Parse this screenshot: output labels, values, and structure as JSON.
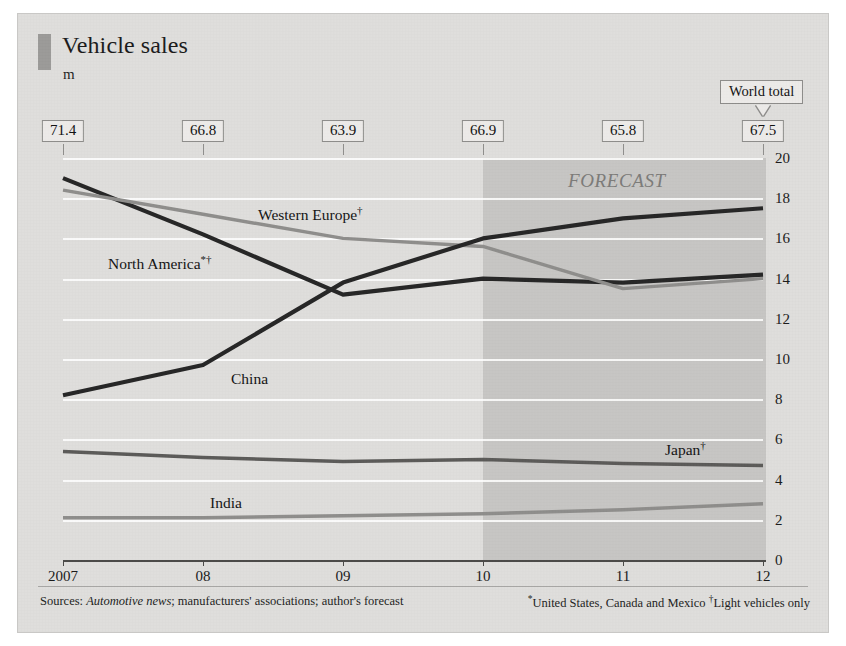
{
  "card": {
    "title": "Vehicle sales",
    "unit": "m",
    "forecast_label": "FORECAST",
    "world_total_label": "World total"
  },
  "footer": {
    "sources_prefix": "Sources: ",
    "sources_italic": "Automotive news",
    "sources_rest": "; manufacturers' associations; author's forecast",
    "footnotes": "*United States, Canada and Mexico  †Light vehicles only"
  },
  "colors": {
    "background": "#dedddb",
    "forecast_band": "#82807e",
    "north_america": "#262626",
    "china": "#262626",
    "western_europe": "#8e8d8b",
    "japan": "#5b5a58",
    "india": "#8e8d8b",
    "gridline": "#ffffff",
    "axis": "#4a4947"
  },
  "chart_data": {
    "type": "line",
    "title": "Vehicle sales",
    "subtitle": "m",
    "xlabel": "",
    "ylabel": "m",
    "ylim": [
      0,
      20
    ],
    "ytick_step": 2,
    "yticks": [
      "20",
      "18",
      "16",
      "14",
      "12",
      "10",
      "8",
      "6",
      "4",
      "2",
      "0"
    ],
    "grid": true,
    "legend": "inline-labels",
    "categories": [
      "2007",
      "08",
      "09",
      "10",
      "11",
      "12"
    ],
    "x_tick_labels": [
      "2007",
      "08",
      "09",
      "10",
      "11",
      "12"
    ],
    "forecast_from": "10",
    "annotations": [
      "FORECAST"
    ],
    "world_total": {
      "label": "World total",
      "values": [
        "71.4",
        "66.8",
        "63.9",
        "66.9",
        "65.8",
        "67.5"
      ]
    },
    "series": [
      {
        "name": "North America*†",
        "label": "North America*†",
        "color": "#262626",
        "values": [
          19.0,
          16.2,
          13.2,
          14.0,
          13.8,
          14.2
        ]
      },
      {
        "name": "Western Europe†",
        "label": "Western Europe†",
        "color": "#8e8d8b",
        "values": [
          18.4,
          17.2,
          16.0,
          15.6,
          13.5,
          14.0
        ]
      },
      {
        "name": "China",
        "label": "China",
        "color": "#262626",
        "values": [
          8.2,
          9.7,
          13.8,
          16.0,
          17.0,
          17.5
        ]
      },
      {
        "name": "Japan†",
        "label": "Japan†",
        "color": "#5b5a58",
        "values": [
          5.4,
          5.1,
          4.9,
          5.0,
          4.8,
          4.7
        ]
      },
      {
        "name": "India",
        "label": "India",
        "color": "#8e8d8b",
        "values": [
          2.1,
          2.1,
          2.2,
          2.3,
          2.5,
          2.8
        ]
      }
    ]
  }
}
